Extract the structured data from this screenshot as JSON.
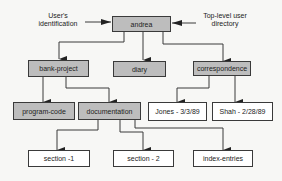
{
  "diagram": {
    "annotations": {
      "user_id": {
        "line1": "User's",
        "line2": "identification"
      },
      "top_level": {
        "line1": "Top-level user",
        "line2": "directory"
      }
    },
    "nodes": {
      "andrea": {
        "label": "andrea",
        "type": "directory"
      },
      "bank_project": {
        "label": "bank-project",
        "type": "directory"
      },
      "diary": {
        "label": "diary",
        "type": "directory"
      },
      "correspondence": {
        "label": "correspondence",
        "type": "directory"
      },
      "program_code": {
        "label": "program-code",
        "type": "directory"
      },
      "documentation": {
        "label": "documentation",
        "type": "directory"
      },
      "jones": {
        "label": "Jones - 3/3/89",
        "type": "file"
      },
      "shah": {
        "label": "Shah - 2/28/89",
        "type": "file"
      },
      "section1": {
        "label": "section -1",
        "type": "file"
      },
      "section2": {
        "label": "section - 2",
        "type": "file"
      },
      "index_entries": {
        "label": "index-entries",
        "type": "file"
      }
    },
    "edges": [
      [
        "andrea",
        "bank_project"
      ],
      [
        "andrea",
        "diary"
      ],
      [
        "andrea",
        "correspondence"
      ],
      [
        "bank_project",
        "program_code"
      ],
      [
        "bank_project",
        "documentation"
      ],
      [
        "correspondence",
        "jones"
      ],
      [
        "correspondence",
        "shah"
      ],
      [
        "documentation",
        "section1"
      ],
      [
        "documentation",
        "section2"
      ],
      [
        "documentation",
        "index_entries"
      ]
    ],
    "colors": {
      "directory_fill": "#bdbdbd",
      "file_fill": "#ffffff",
      "line": "#3a3a3a"
    }
  }
}
